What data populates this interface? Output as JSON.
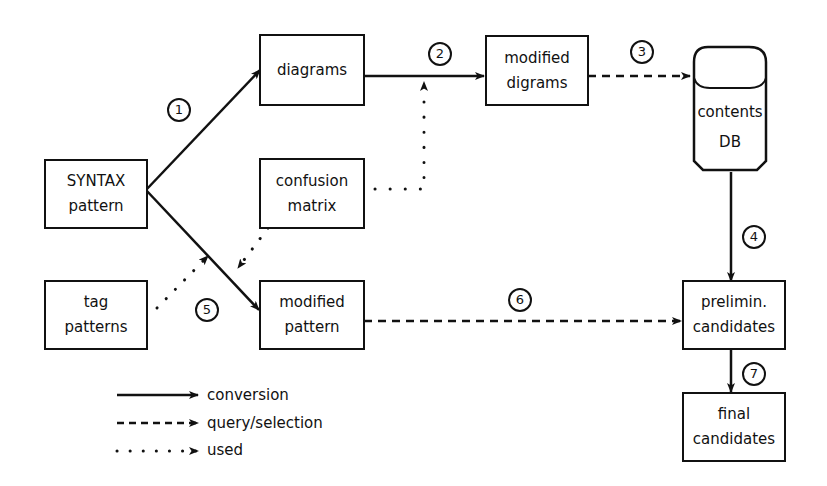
{
  "diagram": {
    "nodes": {
      "syntax_pattern": {
        "lines": [
          "SYNTAX",
          "pattern"
        ]
      },
      "diagrams": {
        "lines": [
          "diagrams"
        ]
      },
      "modified_digrams": {
        "lines": [
          "modified",
          "digrams"
        ]
      },
      "contents_db": {
        "lines": [
          "contents",
          "DB"
        ]
      },
      "confusion_matrix": {
        "lines": [
          "confusion",
          "matrix"
        ]
      },
      "tag_patterns": {
        "lines": [
          "tag",
          "patterns"
        ]
      },
      "modified_pattern": {
        "lines": [
          "modified",
          "pattern"
        ]
      },
      "prelimin_candidates": {
        "lines": [
          "prelimin.",
          "candidates"
        ]
      },
      "final_candidates": {
        "lines": [
          "final",
          "candidates"
        ]
      }
    },
    "steps": [
      "1",
      "2",
      "3",
      "4",
      "5",
      "6",
      "7"
    ],
    "edges": [
      {
        "from": "SYNTAX pattern",
        "to": "diagrams",
        "type": "conversion",
        "step": "1"
      },
      {
        "from": "diagrams",
        "to": "modified digrams",
        "type": "conversion",
        "step": "2"
      },
      {
        "from": "confusion matrix",
        "to": "diagrams→modified digrams",
        "type": "used"
      },
      {
        "from": "modified digrams",
        "to": "contents DB",
        "type": "query/selection",
        "step": "3"
      },
      {
        "from": "contents DB",
        "to": "prelimin. candidates",
        "type": "conversion",
        "step": "4"
      },
      {
        "from": "SYNTAX pattern",
        "to": "modified pattern",
        "type": "conversion"
      },
      {
        "from": "tag patterns",
        "to": "SYNTAX pattern→modified pattern",
        "type": "used",
        "step": "5"
      },
      {
        "from": "confusion matrix",
        "to": "SYNTAX pattern→modified pattern",
        "type": "used",
        "step": "5"
      },
      {
        "from": "modified pattern",
        "to": "prelimin. candidates",
        "type": "query/selection",
        "step": "6"
      },
      {
        "from": "prelimin. candidates",
        "to": "final candidates",
        "type": "conversion",
        "step": "7"
      }
    ],
    "legend": [
      {
        "style": "solid",
        "label": "conversion"
      },
      {
        "style": "dashed",
        "label": "query/selection"
      },
      {
        "style": "dotted",
        "label": "used"
      }
    ],
    "colors": {
      "line": "#111111",
      "background": "#ffffff"
    }
  }
}
